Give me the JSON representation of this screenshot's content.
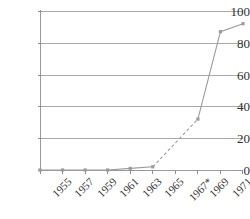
{
  "chart_data": {
    "type": "line",
    "title": "",
    "subtitle": "",
    "xlabel": "",
    "ylabel": "",
    "categories": [
      "1955",
      "1957",
      "1959",
      "1961",
      "1963",
      "1965",
      "1967*",
      "1969",
      "1971",
      "1973"
    ],
    "x_tick_labels": [
      "1955",
      "1957",
      "1959",
      "1961",
      "1963",
      "1965",
      "1967*",
      "1969",
      "1971",
      "1973"
    ],
    "y_tick_labels": [
      "0",
      "20",
      "40",
      "60",
      "80",
      "100"
    ],
    "y_ticks": [
      0,
      20,
      40,
      60,
      80,
      100
    ],
    "ylim": [
      0,
      100
    ],
    "xlim": [
      "1955",
      "1973"
    ],
    "grid": "horizontal",
    "legend": "none",
    "series": [
      {
        "name": "value",
        "color": "#9b9b9b",
        "values": [
          0,
          0,
          0,
          0,
          1,
          2,
          null,
          32,
          87,
          92
        ],
        "segments": [
          {
            "style": "solid",
            "from_index": 0,
            "to_index": 5
          },
          {
            "style": "dashed",
            "from_index": 5,
            "to_index": 7
          },
          {
            "style": "solid",
            "from_index": 7,
            "to_index": 9
          }
        ],
        "marker_indices": [
          0,
          1,
          2,
          3,
          4,
          5,
          7,
          8,
          9
        ]
      }
    ],
    "annotations": [
      "* at 1967 tick label"
    ],
    "colors": {
      "line": "#9b9b9b",
      "grid": "#a9a9a9",
      "axis": "#9a9a9a",
      "text": "#2f2f2f",
      "background": "#ffffff"
    }
  }
}
